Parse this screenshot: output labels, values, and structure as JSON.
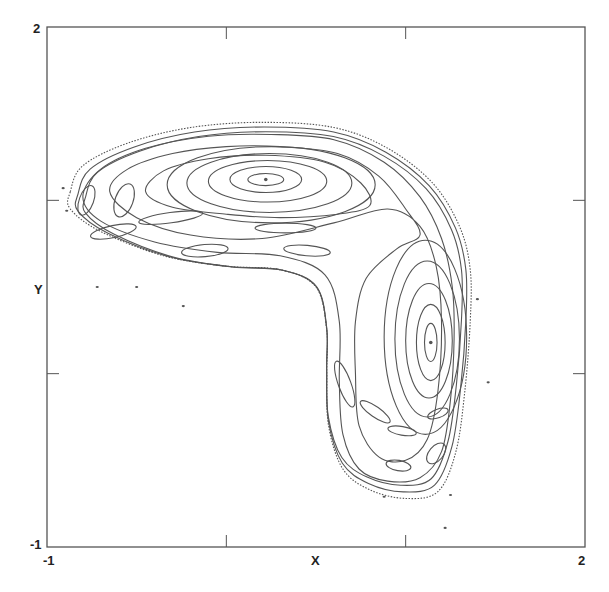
{
  "chart_data": {
    "type": "scatter",
    "title": "",
    "xlabel": "X",
    "ylabel": "Y",
    "xlim": [
      -1,
      2
    ],
    "ylim": [
      -1,
      2
    ],
    "x_tick_labels": [
      "-1",
      "2"
    ],
    "y_tick_labels": [
      "-1",
      "2"
    ],
    "x_ticks": [
      0,
      1
    ],
    "y_ticks": [
      0,
      1
    ],
    "grid": false,
    "legend": null,
    "elliptic_centers": [
      {
        "x": 0.22,
        "y": 1.12
      },
      {
        "x": 1.14,
        "y": 0.18
      }
    ],
    "upper_vortex_rings": [
      {
        "cx": 0.22,
        "cy": 1.12,
        "rx": 0.1,
        "ry": 0.035
      },
      {
        "cx": 0.22,
        "cy": 1.12,
        "rx": 0.2,
        "ry": 0.075
      },
      {
        "cx": 0.23,
        "cy": 1.11,
        "rx": 0.33,
        "ry": 0.12
      },
      {
        "cx": 0.24,
        "cy": 1.1,
        "rx": 0.46,
        "ry": 0.17
      },
      {
        "cx": 0.25,
        "cy": 1.09,
        "rx": 0.58,
        "ry": 0.22
      }
    ],
    "right_vortex_rings": [
      {
        "cx": 1.14,
        "cy": 0.18,
        "rx": 0.035,
        "ry": 0.11
      },
      {
        "cx": 1.14,
        "cy": 0.18,
        "rx": 0.08,
        "ry": 0.22
      },
      {
        "cx": 1.13,
        "cy": 0.19,
        "rx": 0.13,
        "ry": 0.33
      },
      {
        "cx": 1.12,
        "cy": 0.2,
        "rx": 0.18,
        "ry": 0.45
      },
      {
        "cx": 1.11,
        "cy": 0.21,
        "rx": 0.23,
        "ry": 0.56
      }
    ],
    "islands": [
      {
        "cx": -0.78,
        "cy": 1.0,
        "rx": 0.04,
        "ry": 0.09,
        "rot": 20
      },
      {
        "cx": -0.57,
        "cy": 1.0,
        "rx": 0.05,
        "ry": 0.1,
        "rot": 20
      },
      {
        "cx": -0.31,
        "cy": 0.9,
        "rx": 0.18,
        "ry": 0.03,
        "rot": -8
      },
      {
        "cx": -0.63,
        "cy": 0.82,
        "rx": 0.13,
        "ry": 0.035,
        "rot": -12
      },
      {
        "cx": 0.33,
        "cy": 0.84,
        "rx": 0.17,
        "ry": 0.028,
        "rot": 0
      },
      {
        "cx": -0.12,
        "cy": 0.71,
        "rx": 0.13,
        "ry": 0.035,
        "rot": -5
      },
      {
        "cx": 0.45,
        "cy": 0.71,
        "rx": 0.13,
        "ry": 0.03,
        "rot": 5
      },
      {
        "cx": 0.66,
        "cy": -0.06,
        "rx": 0.035,
        "ry": 0.14,
        "rot": -20
      },
      {
        "cx": 0.83,
        "cy": -0.22,
        "rx": 0.1,
        "ry": 0.03,
        "rot": 35
      },
      {
        "cx": 0.98,
        "cy": -0.33,
        "rx": 0.08,
        "ry": 0.025,
        "rot": 10
      },
      {
        "cx": 1.18,
        "cy": -0.23,
        "rx": 0.06,
        "ry": 0.025,
        "rot": -20
      },
      {
        "cx": 1.17,
        "cy": -0.46,
        "rx": 0.04,
        "ry": 0.07,
        "rot": 40
      },
      {
        "cx": 0.96,
        "cy": -0.53,
        "rx": 0.07,
        "ry": 0.03,
        "rot": 10
      }
    ],
    "outer_boundary": [
      [
        -0.87,
        1.05
      ],
      [
        -0.8,
        1.2
      ],
      [
        -0.55,
        1.33
      ],
      [
        -0.2,
        1.42
      ],
      [
        0.2,
        1.45
      ],
      [
        0.6,
        1.42
      ],
      [
        0.9,
        1.3
      ],
      [
        1.15,
        1.1
      ],
      [
        1.3,
        0.85
      ],
      [
        1.36,
        0.6
      ],
      [
        1.36,
        0.3
      ],
      [
        1.33,
        -0.1
      ],
      [
        1.28,
        -0.45
      ],
      [
        1.18,
        -0.68
      ],
      [
        1.0,
        -0.72
      ],
      [
        0.8,
        -0.67
      ],
      [
        0.65,
        -0.55
      ],
      [
        0.57,
        -0.3
      ],
      [
        0.56,
        0.0
      ],
      [
        0.56,
        0.25
      ],
      [
        0.5,
        0.5
      ],
      [
        0.3,
        0.6
      ],
      [
        0.0,
        0.62
      ],
      [
        -0.35,
        0.68
      ],
      [
        -0.7,
        0.82
      ],
      [
        -0.87,
        0.95
      ]
    ],
    "mid_bands": [
      [
        [
          -0.8,
          1.02
        ],
        [
          -0.7,
          1.18
        ],
        [
          -0.45,
          1.3
        ],
        [
          -0.1,
          1.37
        ],
        [
          0.25,
          1.38
        ],
        [
          0.6,
          1.35
        ],
        [
          0.88,
          1.22
        ],
        [
          1.08,
          1.02
        ],
        [
          1.2,
          0.78
        ],
        [
          1.26,
          0.5
        ],
        [
          1.27,
          0.2
        ],
        [
          1.25,
          -0.15
        ],
        [
          1.2,
          -0.45
        ],
        [
          1.08,
          -0.6
        ],
        [
          0.9,
          -0.62
        ],
        [
          0.74,
          -0.55
        ],
        [
          0.65,
          -0.35
        ],
        [
          0.63,
          -0.05
        ],
        [
          0.63,
          0.3
        ],
        [
          0.55,
          0.57
        ],
        [
          0.3,
          0.68
        ],
        [
          -0.05,
          0.7
        ],
        [
          -0.4,
          0.76
        ],
        [
          -0.7,
          0.88
        ]
      ],
      [
        [
          -0.65,
          1.05
        ],
        [
          -0.55,
          1.18
        ],
        [
          -0.3,
          1.27
        ],
        [
          0.0,
          1.31
        ],
        [
          0.3,
          1.31
        ],
        [
          0.62,
          1.27
        ],
        [
          0.85,
          1.14
        ],
        [
          1.0,
          0.95
        ],
        [
          1.08,
          0.8
        ],
        [
          0.95,
          0.72
        ],
        [
          0.78,
          0.55
        ],
        [
          0.72,
          0.3
        ],
        [
          0.72,
          0.0
        ],
        [
          0.74,
          -0.3
        ],
        [
          0.85,
          -0.48
        ],
        [
          1.0,
          -0.5
        ],
        [
          1.12,
          -0.38
        ],
        [
          1.18,
          -0.1
        ],
        [
          1.2,
          0.3
        ],
        [
          1.17,
          0.62
        ],
        [
          1.08,
          0.85
        ],
        [
          0.9,
          0.95
        ],
        [
          0.6,
          0.87
        ],
        [
          0.2,
          0.78
        ],
        [
          -0.2,
          0.8
        ],
        [
          -0.5,
          0.9
        ]
      ],
      [
        [
          -0.45,
          1.05
        ],
        [
          -0.35,
          1.17
        ],
        [
          -0.1,
          1.24
        ],
        [
          0.22,
          1.26
        ],
        [
          0.55,
          1.22
        ],
        [
          0.75,
          1.1
        ],
        [
          0.8,
          0.97
        ],
        [
          0.62,
          0.92
        ],
        [
          0.3,
          0.9
        ],
        [
          0.0,
          0.92
        ],
        [
          -0.3,
          0.96
        ]
      ]
    ],
    "scattered_points": [
      [
        -0.91,
        1.07
      ],
      [
        -0.89,
        0.94
      ],
      [
        -0.72,
        0.5
      ],
      [
        -0.24,
        0.39
      ],
      [
        0.88,
        -0.71
      ],
      [
        1.25,
        -0.7
      ],
      [
        1.4,
        0.43
      ],
      [
        1.46,
        -0.05
      ],
      [
        1.22,
        -0.89
      ],
      [
        -0.5,
        0.5
      ]
    ]
  }
}
